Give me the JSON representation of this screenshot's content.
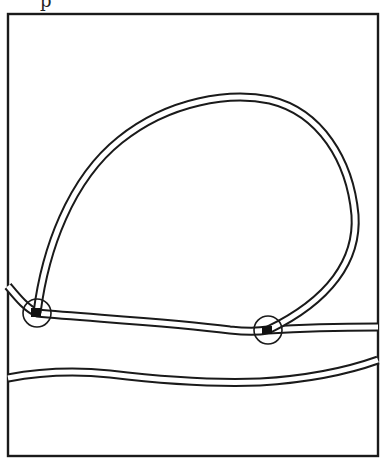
{
  "figure": {
    "type": "line-drawing",
    "header_fragment": "p",
    "colors": {
      "ink": "#1a1a1a",
      "background": "#ffffff"
    },
    "frame": {
      "x": 8,
      "y": 14,
      "width": 370,
      "height": 442
    },
    "junctions": [
      {
        "name": "left-junction",
        "cx": 37,
        "cy": 313,
        "r": 14
      },
      {
        "name": "right-junction",
        "cx": 268,
        "cy": 330,
        "r": 14
      }
    ],
    "tracks": [
      {
        "name": "loop-track",
        "shape": "teardrop loop from left junction up over top and down to right junction"
      },
      {
        "name": "main-track",
        "shape": "horizontal track from left edge through both junctions to right edge"
      },
      {
        "name": "lower-track",
        "shape": "wavy horizontal track across lower portion, rising at right"
      }
    ]
  }
}
